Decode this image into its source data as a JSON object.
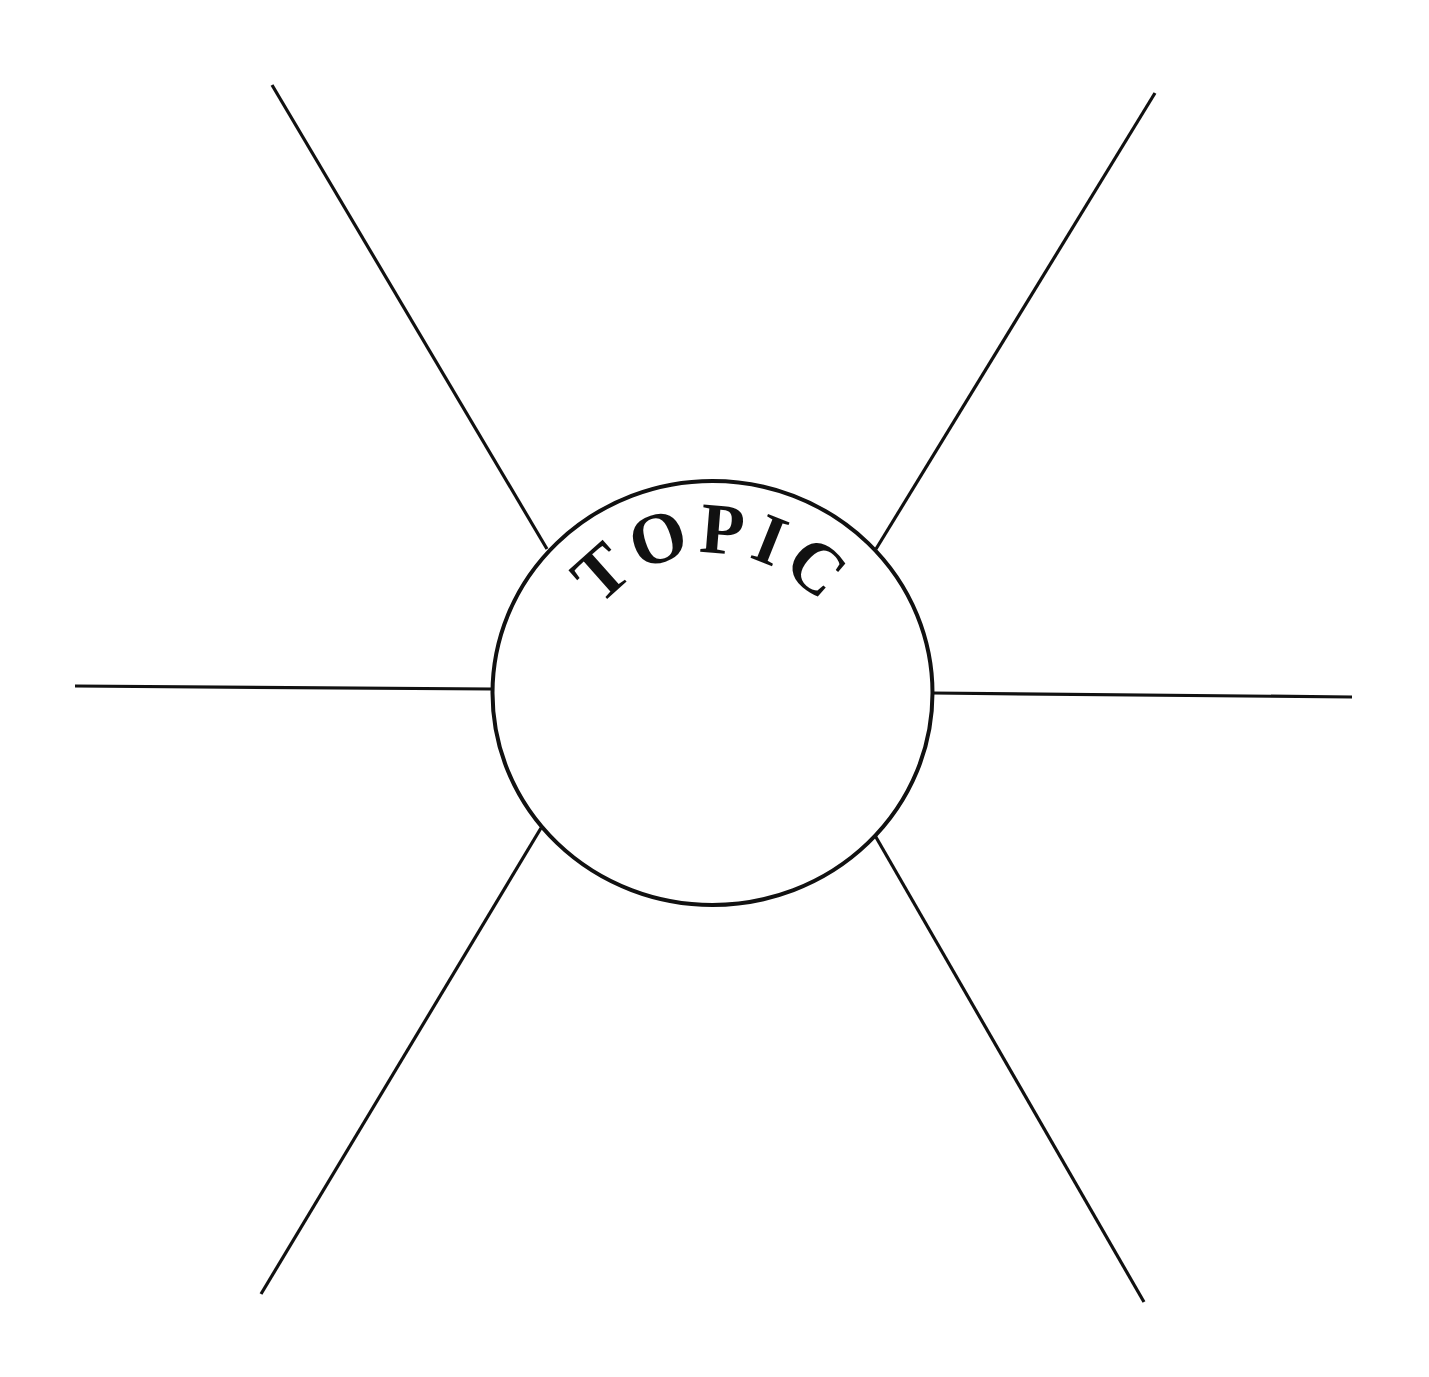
{
  "diagram": {
    "type": "spider-map",
    "center": {
      "label": "TOPIC",
      "shape": "circle",
      "cx": 712.5,
      "cy": 693,
      "rx": 220,
      "ry": 212
    },
    "spokes": [
      {
        "id": "top-left",
        "x1": 272,
        "y1": 85,
        "x2": 547,
        "y2": 549
      },
      {
        "id": "top-right",
        "x1": 1155,
        "y1": 93,
        "x2": 876,
        "y2": 549
      },
      {
        "id": "left",
        "x1": 75,
        "y1": 686,
        "x2": 492,
        "y2": 689
      },
      {
        "id": "right",
        "x1": 932,
        "y1": 693,
        "x2": 1352,
        "y2": 697
      },
      {
        "id": "bottom-left",
        "x1": 541,
        "y1": 828,
        "x2": 261,
        "y2": 1294
      },
      {
        "id": "bottom-right",
        "x1": 873,
        "y1": 832,
        "x2": 1144,
        "y2": 1302
      }
    ],
    "colors": {
      "stroke": "#111111",
      "background": "#ffffff"
    }
  }
}
